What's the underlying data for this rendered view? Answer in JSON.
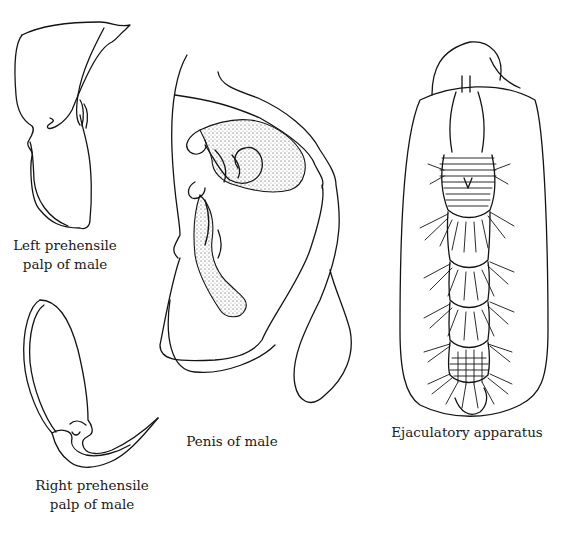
{
  "figure": {
    "panels": [
      {
        "id": "left-palp",
        "caption_lines": [
          "Left prehensile",
          "palp of male"
        ]
      },
      {
        "id": "right-palp",
        "caption_lines": [
          "Right prehensile",
          "palp of male"
        ]
      },
      {
        "id": "penis",
        "caption_lines": [
          "Penis of male"
        ]
      },
      {
        "id": "ejaculatory",
        "caption_lines": [
          "Ejaculatory apparatus"
        ]
      }
    ],
    "colors": {
      "background": "#ffffff",
      "ink": "#141414"
    }
  }
}
